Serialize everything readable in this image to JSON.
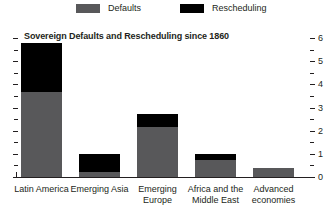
{
  "legend": {
    "position": "top",
    "entries": [
      {
        "label": "Defaults",
        "color": "#58585a",
        "icon": "gray-square-swatch"
      },
      {
        "label": "Rescheduling",
        "color": "#000000",
        "icon": "black-square-swatch"
      }
    ]
  },
  "chart_data": {
    "type": "bar",
    "title": "Sovereign Defaults and Rescheduling since 1860",
    "subtitle": "",
    "xlabel": "",
    "ylabel": "",
    "stacked": true,
    "grid": false,
    "legend_position": "top",
    "categories": [
      "Latin America",
      "Emerging Asia",
      "Emerging Europe",
      "Africa and the Middle East",
      "Advanced economies"
    ],
    "series": [
      {
        "name": "Defaults",
        "color": "#58585a",
        "values": [
          3.65,
          0.2,
          2.15,
          0.75,
          0.4
        ]
      },
      {
        "name": "Rescheduling",
        "color": "#000000",
        "values": [
          2.15,
          0.8,
          0.55,
          0.25,
          0.0
        ]
      }
    ],
    "totals": [
      5.8,
      1.0,
      2.7,
      1.0,
      0.4
    ],
    "yaxis": {
      "side": "right",
      "ylim": [
        0,
        6
      ],
      "major_ticks": [
        0,
        1,
        2,
        3,
        4,
        5,
        6
      ],
      "minor_ticks": [
        0.5,
        1.5,
        2.5,
        3.5,
        4.5,
        5.5
      ],
      "tick_labels": [
        "0",
        "1",
        "2",
        "3",
        "4",
        "5",
        "6"
      ]
    },
    "yaxis_left": {
      "side": "left",
      "ylim": [
        0,
        6
      ],
      "tick_labels": []
    }
  }
}
